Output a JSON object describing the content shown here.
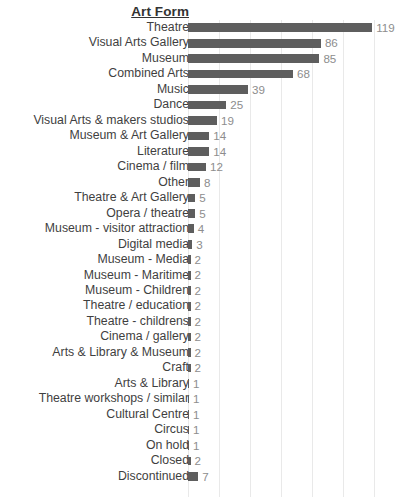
{
  "chart_data": {
    "type": "bar",
    "orientation": "horizontal",
    "title": "Art Form",
    "xlabel": "",
    "ylabel": "Art Form",
    "xlim": [
      0,
      127
    ],
    "grid": true,
    "gridline_values": [
      0,
      20,
      40,
      60,
      80,
      100,
      120
    ],
    "legend": "none",
    "bar_color": "#5e5e5e",
    "label_color": "#3f3f3f",
    "value_color": "#8d8d8d",
    "gridline_color": "#e9e9e9",
    "background_color": "#ffffff",
    "categories": [
      "Theatre",
      "Visual Arts Gallery",
      "Museum",
      "Combined Arts",
      "Music",
      "Dance",
      "Visual Arts & makers studios",
      "Museum & Art Gallery",
      "Literature",
      "Cinema / film",
      "Other",
      "Theatre & Art Gallery",
      "Opera / theatre",
      "Museum - visitor attraction",
      "Digital media",
      "Museum - Media",
      "Museum - Maritime",
      "Museum - Children",
      "Theatre / education",
      "Theatre - childrens",
      "Cinema / gallery",
      "Arts & Library & Museum",
      "Craft",
      "Arts & Library",
      "Theatre workshops / similar",
      "Cultural Centre",
      "Circus",
      "On hold",
      "Closed",
      "Discontinued"
    ],
    "values": [
      119,
      86,
      85,
      68,
      39,
      25,
      19,
      14,
      14,
      12,
      8,
      5,
      5,
      4,
      3,
      2,
      2,
      2,
      2,
      2,
      2,
      2,
      2,
      1,
      1,
      1,
      1,
      1,
      2,
      7
    ],
    "rows": [
      {
        "label": "Theatre",
        "value": 119,
        "value_text": "119"
      },
      {
        "label": "Visual Arts Gallery",
        "value": 86,
        "value_text": "86"
      },
      {
        "label": "Museum",
        "value": 85,
        "value_text": "85"
      },
      {
        "label": "Combined Arts",
        "value": 68,
        "value_text": "68"
      },
      {
        "label": "Music",
        "value": 39,
        "value_text": "39"
      },
      {
        "label": "Dance",
        "value": 25,
        "value_text": "25"
      },
      {
        "label": "Visual Arts & makers studios",
        "value": 19,
        "value_text": "19"
      },
      {
        "label": "Museum & Art Gallery",
        "value": 14,
        "value_text": "14"
      },
      {
        "label": "Literature",
        "value": 14,
        "value_text": "14"
      },
      {
        "label": "Cinema / film",
        "value": 12,
        "value_text": "12"
      },
      {
        "label": "Other",
        "value": 8,
        "value_text": "8"
      },
      {
        "label": "Theatre & Art Gallery",
        "value": 5,
        "value_text": "5"
      },
      {
        "label": "Opera / theatre",
        "value": 5,
        "value_text": "5"
      },
      {
        "label": "Museum - visitor attraction",
        "value": 4,
        "value_text": "4"
      },
      {
        "label": "Digital media",
        "value": 3,
        "value_text": "3"
      },
      {
        "label": "Museum - Media",
        "value": 2,
        "value_text": "2"
      },
      {
        "label": "Museum - Maritime",
        "value": 2,
        "value_text": "2"
      },
      {
        "label": "Museum - Children",
        "value": 2,
        "value_text": "2"
      },
      {
        "label": "Theatre / education",
        "value": 2,
        "value_text": "2"
      },
      {
        "label": "Theatre - childrens",
        "value": 2,
        "value_text": "2"
      },
      {
        "label": "Cinema / gallery",
        "value": 2,
        "value_text": "2"
      },
      {
        "label": "Arts & Library & Museum",
        "value": 2,
        "value_text": "2"
      },
      {
        "label": "Craft",
        "value": 2,
        "value_text": "2"
      },
      {
        "label": "Arts & Library",
        "value": 1,
        "value_text": "1"
      },
      {
        "label": "Theatre workshops / similar",
        "value": 1,
        "value_text": "1"
      },
      {
        "label": "Cultural Centre",
        "value": 1,
        "value_text": "1"
      },
      {
        "label": "Circus",
        "value": 1,
        "value_text": "1"
      },
      {
        "label": "On hold",
        "value": 1,
        "value_text": "1"
      },
      {
        "label": "Closed",
        "value": 2,
        "value_text": "2"
      },
      {
        "label": "Discontinued",
        "value": 7,
        "value_text": "7"
      }
    ]
  }
}
